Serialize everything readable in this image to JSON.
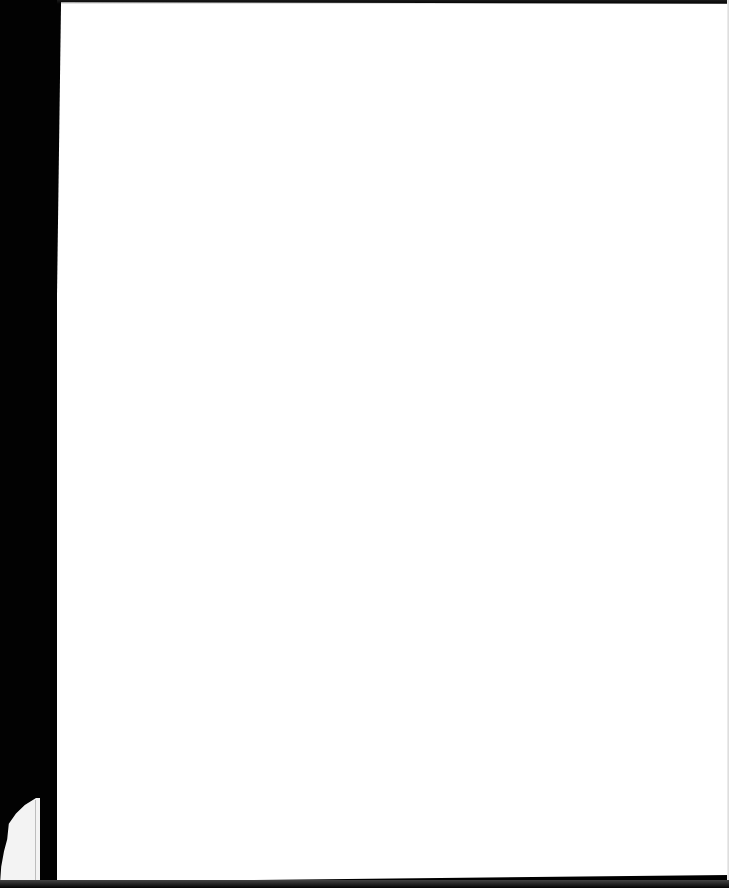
{
  "document": {
    "type": "blank scanned page",
    "text_content": "",
    "colors": {
      "page": "#ffffff",
      "background": "#000000",
      "fragment": "#f3f3f3"
    }
  }
}
